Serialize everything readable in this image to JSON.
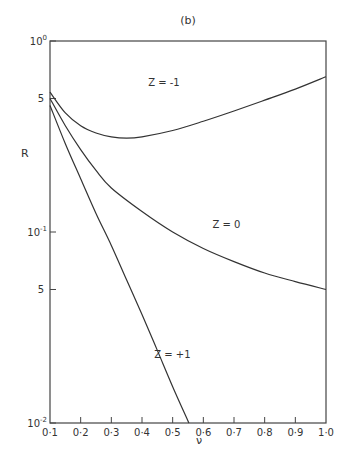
{
  "chart_data": {
    "type": "line",
    "title": "(b)",
    "xlabel": "ν",
    "ylabel": "R",
    "xscale": "linear",
    "yscale": "log",
    "xlim": [
      0.1,
      1.0
    ],
    "ylim": [
      0.01,
      1.0
    ],
    "xticks": [
      "0·1",
      "0·2",
      "0·3",
      "0·4",
      "0·5",
      "0·6",
      "0·7",
      "0·8",
      "0·9",
      "1·0"
    ],
    "yticks": [
      {
        "value": 1.0,
        "label": "10",
        "sup": "0"
      },
      {
        "value": 0.5,
        "label": "5",
        "sup": ""
      },
      {
        "value": 0.1,
        "label": "10",
        "sup": "-1"
      },
      {
        "value": 0.05,
        "label": "5",
        "sup": ""
      },
      {
        "value": 0.01,
        "label": "10",
        "sup": "-2"
      }
    ],
    "grid": false,
    "series": [
      {
        "name": "Z = -1",
        "label_pos": [
          0.42,
          0.58
        ],
        "x": [
          0.1,
          0.15,
          0.2,
          0.25,
          0.3,
          0.35,
          0.4,
          0.5,
          0.6,
          0.7,
          0.8,
          0.9,
          1.0
        ],
        "y": [
          0.54,
          0.42,
          0.36,
          0.33,
          0.315,
          0.31,
          0.315,
          0.34,
          0.38,
          0.43,
          0.49,
          0.56,
          0.65
        ]
      },
      {
        "name": "Z = 0",
        "label_pos": [
          0.63,
          0.105
        ],
        "x": [
          0.1,
          0.15,
          0.2,
          0.25,
          0.3,
          0.4,
          0.5,
          0.6,
          0.7,
          0.8,
          0.9,
          1.0
        ],
        "y": [
          0.5,
          0.36,
          0.27,
          0.21,
          0.17,
          0.128,
          0.1,
          0.082,
          0.07,
          0.061,
          0.055,
          0.05
        ]
      },
      {
        "name": "Z = +1",
        "label_pos": [
          0.44,
          0.022
        ],
        "x": [
          0.1,
          0.15,
          0.2,
          0.25,
          0.3,
          0.35,
          0.4,
          0.45,
          0.5,
          0.553
        ],
        "y": [
          0.46,
          0.29,
          0.19,
          0.125,
          0.085,
          0.056,
          0.037,
          0.024,
          0.0155,
          0.01
        ]
      }
    ]
  }
}
